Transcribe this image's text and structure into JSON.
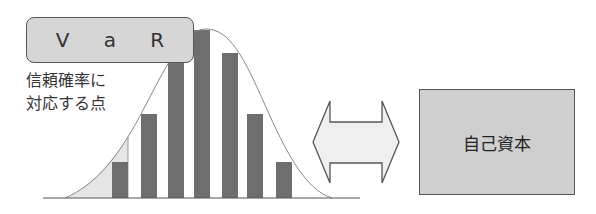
{
  "var_label": "V a R",
  "confidence_note": {
    "line1": "信頼確率に",
    "line2": "対応する点"
  },
  "capital_label": "自己資本",
  "arrow": {
    "type": "double-headed",
    "meaning": "compare"
  },
  "colors": {
    "bar": "#6e6e6e",
    "label_fill": "#d6d6d6",
    "capital_fill": "#cfcfcf",
    "tail_shade": "#e6e6e6",
    "arrow_fill": "#efefef",
    "curve": "#888888"
  },
  "chart_data": {
    "type": "bar",
    "title": "",
    "xlabel": "",
    "ylabel": "",
    "categories": [
      "1",
      "2",
      "3",
      "4",
      "5",
      "6",
      "7"
    ],
    "values": [
      36,
      84,
      148,
      168,
      145,
      84,
      36
    ],
    "overlay": "normal distribution curve with shaded left tail up to VaR point",
    "annotations": [
      "V a R",
      "信頼確率に対応する点"
    ]
  }
}
